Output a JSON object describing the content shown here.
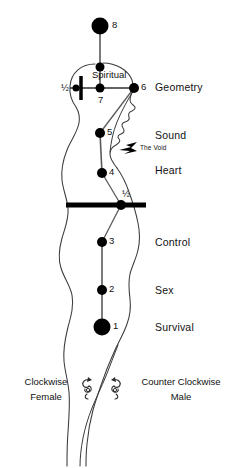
{
  "diagram": {
    "colors": {
      "ink": "#000000",
      "outline": "#333333",
      "text": "#111111",
      "background": "#ffffff"
    },
    "nodes": [
      {
        "id": "node-8",
        "number": "8",
        "cx": 100,
        "cy": 26,
        "r": 8.5,
        "label_dx": 12,
        "label_dy": 1
      },
      {
        "id": "node-crown",
        "number": "",
        "cx": 100,
        "cy": 67,
        "r": 4.5,
        "label_dx": 0,
        "label_dy": 0
      },
      {
        "id": "node-half-head",
        "number": "",
        "cx": 76,
        "cy": 88,
        "r": 3.5,
        "label_dx": 0,
        "label_dy": 0
      },
      {
        "id": "node-7",
        "number": "7",
        "cx": 100,
        "cy": 88,
        "r": 4.5,
        "label_dx": -2,
        "label_dy": 14
      },
      {
        "id": "node-6",
        "number": "6",
        "cx": 134,
        "cy": 88,
        "r": 5.0,
        "label_dx": 7,
        "label_dy": 1
      },
      {
        "id": "node-5",
        "number": "5",
        "cx": 100,
        "cy": 133,
        "r": 5.0,
        "label_dx": 7,
        "label_dy": 1
      },
      {
        "id": "node-4",
        "number": "4",
        "cx": 102,
        "cy": 173,
        "r": 5.0,
        "label_dx": 7,
        "label_dy": 1
      },
      {
        "id": "node-half-waist",
        "number": "",
        "cx": 121,
        "cy": 205,
        "r": 5.0,
        "label_dx": 0,
        "label_dy": 0
      },
      {
        "id": "node-3",
        "number": "3",
        "cx": 102,
        "cy": 242,
        "r": 5.0,
        "label_dx": 7,
        "label_dy": 1
      },
      {
        "id": "node-2",
        "number": "2",
        "cx": 102,
        "cy": 290,
        "r": 5.0,
        "label_dx": 7,
        "label_dy": 1
      },
      {
        "id": "node-1",
        "number": "1",
        "cx": 102,
        "cy": 327,
        "r": 8.5,
        "label_dx": 11,
        "label_dy": 1
      }
    ],
    "fractions": [
      {
        "id": "fraction-head",
        "text": "½",
        "x": 61,
        "y": 83
      },
      {
        "id": "fraction-waist",
        "text": "½",
        "x": 122,
        "y": 189
      }
    ],
    "center_labels": [
      {
        "id": "label-spiritual",
        "text": "Spiritual",
        "x": 92,
        "y": 70
      }
    ],
    "side_labels": [
      {
        "id": "label-geometry",
        "text": "Geometry",
        "x": 155,
        "y": 82
      },
      {
        "id": "label-sound",
        "text": "Sound",
        "x": 155,
        "y": 130
      },
      {
        "id": "label-heart",
        "text": "Heart",
        "x": 155,
        "y": 165
      },
      {
        "id": "label-control",
        "text": "Control",
        "x": 155,
        "y": 237
      },
      {
        "id": "label-sex",
        "text": "Sex",
        "x": 155,
        "y": 285
      },
      {
        "id": "label-survival",
        "text": "Survival",
        "x": 155,
        "y": 322
      }
    ],
    "void_label": {
      "id": "label-the-void",
      "text": "The Void",
      "x": 140,
      "y": 145
    },
    "footer": {
      "left": {
        "id": "footer-left",
        "line1": "Clockwise",
        "line2": "Female",
        "x": 8,
        "y": 377,
        "width": 76
      },
      "right": {
        "id": "footer-right",
        "line1": "Counter Clockwise",
        "line2": "Male",
        "x": 130,
        "y": 377,
        "width": 102
      }
    },
    "spin_arrows": [
      {
        "id": "spin-arrow-female",
        "direction": "clockwise",
        "x": 86,
        "y": 390
      },
      {
        "id": "spin-arrow-male",
        "direction": "counter-clockwise",
        "x": 117,
        "y": 390
      }
    ],
    "bars": [
      {
        "id": "bar-waist",
        "orientation": "horizontal",
        "x1": 66,
        "y1": 205,
        "x2": 146,
        "y2": 205,
        "thickness": 5
      },
      {
        "id": "bar-head",
        "orientation": "vertical",
        "x1": 81,
        "y1": 76,
        "x2": 81,
        "y2": 100,
        "thickness": 3.5
      }
    ]
  }
}
